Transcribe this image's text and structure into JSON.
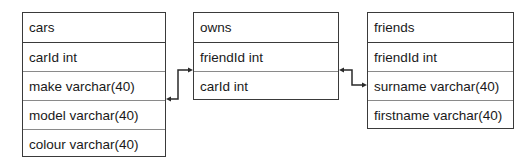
{
  "diagram": {
    "tables": [
      {
        "name": "cars",
        "fields": [
          "carId int",
          "make varchar(40)",
          "model varchar(40)",
          "colour varchar(40)"
        ]
      },
      {
        "name": "owns",
        "fields": [
          "friendId int",
          "carId int"
        ]
      },
      {
        "name": "friends",
        "fields": [
          "friendId int",
          "surname varchar(40)",
          "firstname varchar(40)"
        ]
      }
    ],
    "relations": [
      {
        "from": "cars",
        "to": "owns"
      },
      {
        "from": "owns",
        "to": "friends"
      }
    ],
    "colors": {
      "border": "#3a3a3a",
      "divider": "#8a8a8a",
      "line": "#2a2a2a",
      "text": "#1a1a1a"
    }
  }
}
